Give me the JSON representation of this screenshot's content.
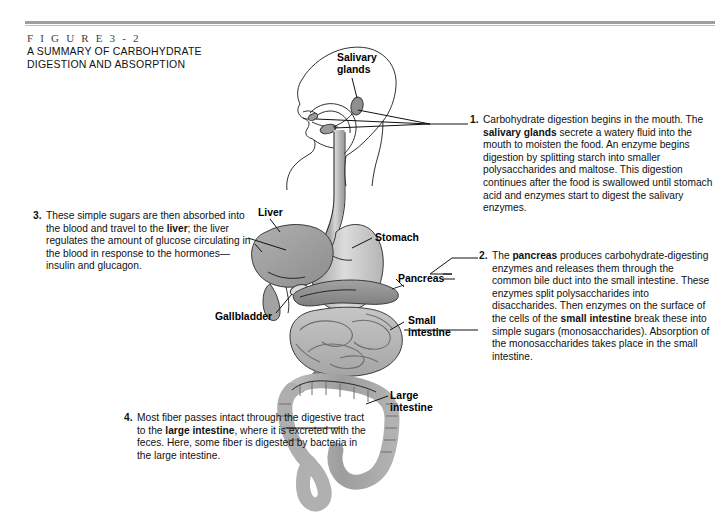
{
  "figure": {
    "number": "F I G U R E   3 - 2",
    "title_line1": "A SUMMARY OF CARBOHYDRATE",
    "title_line2": "DIGESTION AND ABSORPTION"
  },
  "labels": {
    "salivary_glands_l1": "Salivary",
    "salivary_glands_l2": "glands",
    "liver": "Liver",
    "stomach": "Stomach",
    "pancreas": "Pancreas",
    "gallbladder": "Gallbladder",
    "small_intestine_l1": "Small",
    "small_intestine_l2": "intestine",
    "large_intestine_l1": "Large",
    "large_intestine_l2": "intestine"
  },
  "notes": [
    {
      "number": "1.",
      "segments": [
        {
          "text": "Carbohydrate digestion begins in the mouth. The ",
          "bold": false
        },
        {
          "text": "salivary glands",
          "bold": true
        },
        {
          "text": " secrete a watery fluid into the mouth to moisten the food. An enzyme begins digestion by splitting starch into smaller polysaccharides and maltose. This digestion continues after the food is swallowed until stomach acid and enzymes start to digest the salivary enzymes.",
          "bold": false
        }
      ]
    },
    {
      "number": "2.",
      "segments": [
        {
          "text": "The ",
          "bold": false
        },
        {
          "text": "pancreas",
          "bold": true
        },
        {
          "text": " produces carbohydrate-digesting enzymes and releases them through the common bile duct into the small intestine. These enzymes split polysaccharides into disaccharides. Then enzymes on the surface of the cells of the ",
          "bold": false
        },
        {
          "text": "small intestine",
          "bold": true
        },
        {
          "text": " break these into simple sugars (monosaccharides). Absorption of the monosaccharides takes place in the small intestine.",
          "bold": false
        }
      ]
    },
    {
      "number": "3.",
      "segments": [
        {
          "text": "These simple sugars are then absorbed into the blood and travel to the ",
          "bold": false
        },
        {
          "text": "liver",
          "bold": true
        },
        {
          "text": "; the liver regulates the amount of glucose circulating in the blood in response to the hormones—insulin and glucagon.",
          "bold": false
        }
      ]
    },
    {
      "number": "4.",
      "segments": [
        {
          "text": "Most fiber passes intact through the digestive tract to the ",
          "bold": false
        },
        {
          "text": "large intestine",
          "bold": true
        },
        {
          "text": ", where it is excreted with the feces. Here, some fiber is digested by bacteria in the large intestine.",
          "bold": false
        }
      ]
    }
  ],
  "colors": {
    "background": "#ffffff",
    "rule": "#9aa0a6",
    "liver": "#9a9a9a",
    "stomach": "#c9c9c9",
    "pancreas": "#8e8e8e",
    "small_intestine": "#b4b4b4",
    "large_intestine": "#a8a8a8",
    "gallbladder": "#d8d8d8",
    "outline": "#3a3a3a",
    "text": "#111111"
  }
}
